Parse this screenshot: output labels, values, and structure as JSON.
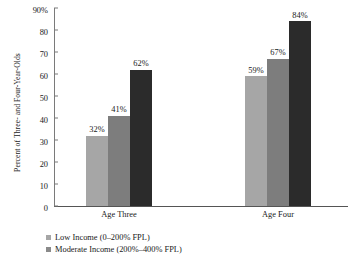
{
  "chart_data": {
    "type": "bar",
    "title": "",
    "xlabel": "",
    "ylabel": "Percent of Three- and Four-Year-Olds",
    "ylim": [
      0,
      90
    ],
    "ytick_labels": [
      "90%",
      "80",
      "70",
      "60",
      "50",
      "40",
      "30",
      "20",
      "10",
      "0"
    ],
    "ytick_values": [
      90,
      80,
      70,
      60,
      50,
      40,
      30,
      20,
      10,
      0
    ],
    "grid": false,
    "legend_position": "bottom-left",
    "categories": [
      "Age Three",
      "Age Four"
    ],
    "series": [
      {
        "name": "Low Income (0–200% FPL)",
        "color": "#a6a6a6",
        "values": [
          32,
          59
        ],
        "labels": [
          "32%",
          "59%"
        ]
      },
      {
        "name": "Moderate Income (200%–400% FPL)",
        "color": "#7d7d7d",
        "values": [
          41,
          67
        ],
        "labels": [
          "41%",
          "67%"
        ]
      },
      {
        "name": "",
        "color": "#2b2b2b",
        "values": [
          62,
          84
        ],
        "labels": [
          "62%",
          "84%"
        ]
      }
    ]
  },
  "legend": {
    "entries": [
      {
        "label": "Low Income (0–200% FPL)",
        "color": "#a6a6a6"
      },
      {
        "label": "Moderate Income (200%–400% FPL)",
        "color": "#8a8a8a"
      }
    ]
  }
}
